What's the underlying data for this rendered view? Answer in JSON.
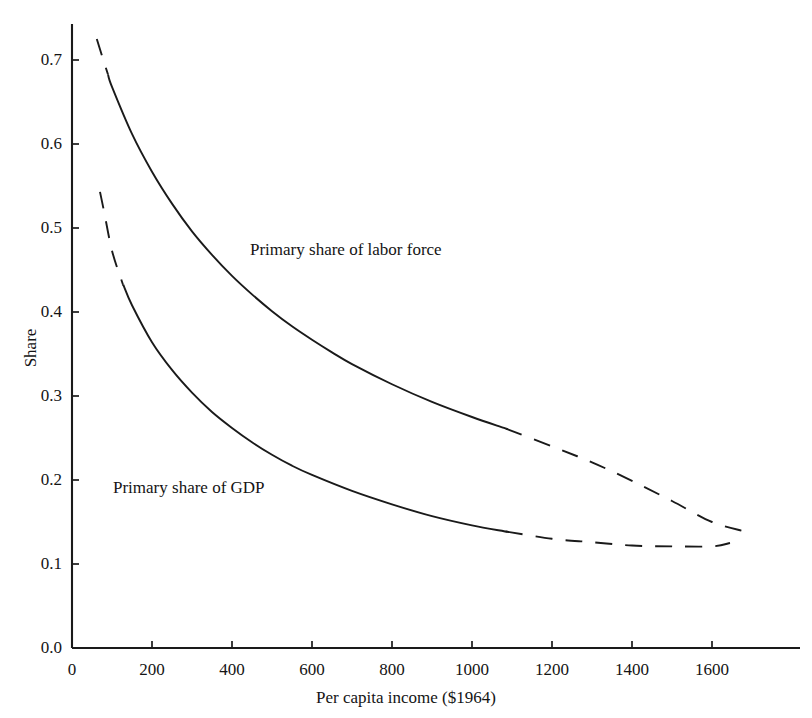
{
  "chart_data": {
    "type": "line",
    "title": "",
    "xlabel": "Per capita income ($1964)",
    "ylabel": "Share",
    "xlim": [
      0,
      1700
    ],
    "ylim": [
      0.0,
      0.75
    ],
    "xticks": [
      0,
      200,
      400,
      600,
      800,
      1000,
      1200,
      1400,
      1600
    ],
    "xtick_labels": [
      "0",
      "200",
      "400",
      "600",
      "800",
      "1000",
      "1200",
      "1400",
      "1600"
    ],
    "yticks": [
      0.0,
      0.1,
      0.2,
      0.3,
      0.4,
      0.5,
      0.6,
      0.7
    ],
    "ytick_labels": [
      "0.0",
      "0.1",
      "0.2",
      "0.3",
      "0.4",
      "0.5",
      "0.6",
      "0.7"
    ],
    "grid": false,
    "legend": "inline-annotations",
    "line_color": "#1a1a1a",
    "series": [
      {
        "name": "Primary share of labor force",
        "annotation": "Primary share of labor force",
        "x": [
          62,
          75,
          100,
          150,
          200,
          250,
          300,
          350,
          400,
          450,
          500,
          550,
          600,
          650,
          700,
          800,
          900,
          1000,
          1080,
          1200,
          1300,
          1400,
          1500,
          1600,
          1680
        ],
        "y": [
          0.725,
          0.705,
          0.668,
          0.612,
          0.567,
          0.529,
          0.496,
          0.468,
          0.443,
          0.421,
          0.401,
          0.383,
          0.367,
          0.352,
          0.338,
          0.314,
          0.293,
          0.275,
          0.262,
          0.24,
          0.221,
          0.199,
          0.175,
          0.15,
          0.139
        ],
        "dash_head_until_x": 90,
        "dash_tail_from_x": 1085
      },
      {
        "name": "Primary share of GDP",
        "annotation": "Primary share of GDP",
        "x": [
          70,
          80,
          100,
          125,
          150,
          200,
          250,
          300,
          350,
          400,
          450,
          500,
          550,
          600,
          700,
          800,
          900,
          1000,
          1080,
          1200,
          1300,
          1400,
          1500,
          1600,
          1645
        ],
        "y": [
          0.543,
          0.52,
          0.473,
          0.436,
          0.408,
          0.364,
          0.331,
          0.304,
          0.281,
          0.262,
          0.245,
          0.23,
          0.217,
          0.206,
          0.187,
          0.171,
          0.157,
          0.146,
          0.139,
          0.13,
          0.126,
          0.122,
          0.121,
          0.121,
          0.125
        ]
      }
    ],
    "annotations": [
      {
        "text": "Primary share of labor force",
        "x": 445,
        "y": 0.455
      },
      {
        "text": "Primary share of GDP",
        "x": 105,
        "y": 0.175
      }
    ]
  }
}
